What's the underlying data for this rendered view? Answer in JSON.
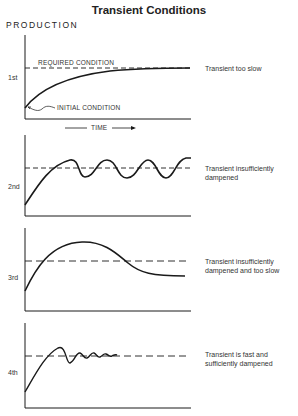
{
  "title": "Transient Conditions",
  "y_axis_label": "PRODUCTION",
  "x_axis_label": "TIME",
  "annotations": {
    "required": "REQUIRED CONDITION",
    "initial": "INITIAL CONDITION"
  },
  "panels": [
    {
      "num": "1st",
      "description": "Transient too slow"
    },
    {
      "num": "2nd",
      "description": "Transient insufficiently dampened"
    },
    {
      "num": "3rd",
      "description": "Transient insufficiently dampened and too slow"
    },
    {
      "num": "4th",
      "description": "Transient is fast and sufficiently dampened"
    }
  ],
  "colors": {
    "line": "#1a1a1a",
    "background": "#ffffff"
  }
}
